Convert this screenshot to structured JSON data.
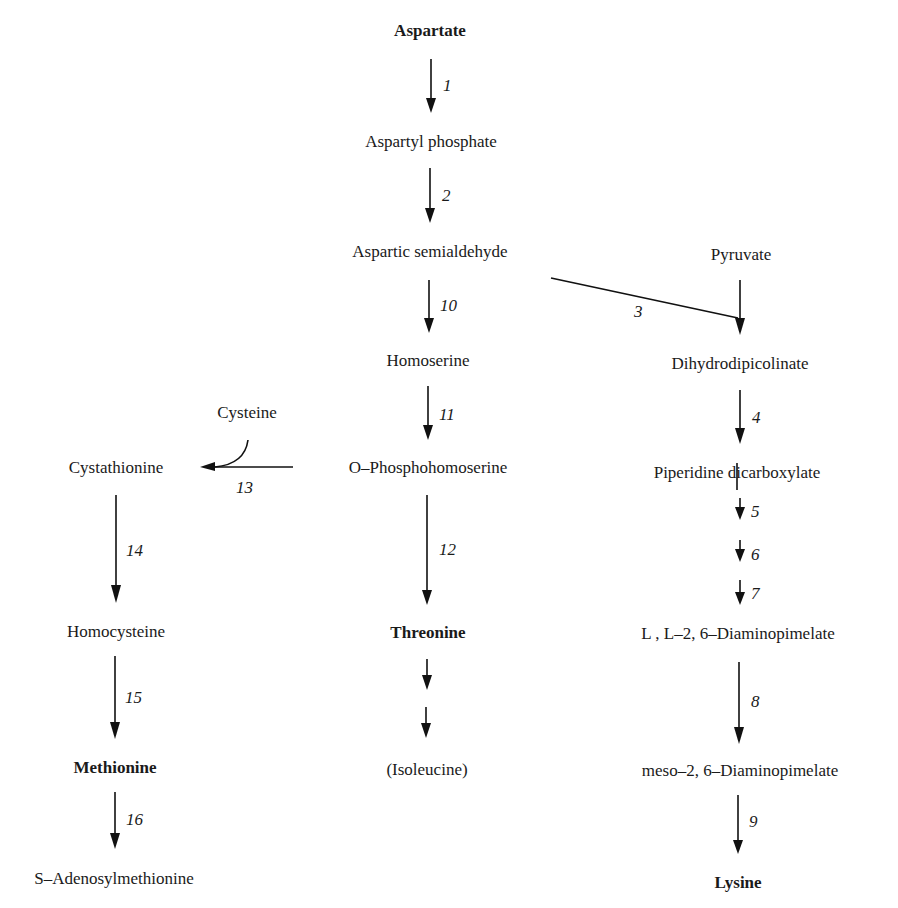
{
  "diagram": {
    "type": "metabolic-pathway",
    "nodes": {
      "aspartate": "Aspartate",
      "aspartyl_phosphate": "Aspartyl phosphate",
      "aspartic_semialdehyde": "Aspartic semialdehyde",
      "pyruvate": "Pyruvate",
      "homoserine": "Homoserine",
      "dihydrodipicolinate": "Dihydrodipicolinate",
      "cysteine": "Cysteine",
      "cystathionine": "Cystathionine",
      "o_phosphohomoserine": "O–Phosphohomoserine",
      "piperidine_dicarboxylate": "Piperidine dicarboxylate",
      "homocysteine": "Homocysteine",
      "threonine": "Threonine",
      "ll_diaminopimelate_prefix": "L , L",
      "ll_diaminopimelate_suffix": "–2, 6–Diaminopimelate",
      "methionine": "Methionine",
      "isoleucine": "(Isoleucine)",
      "meso_diaminopimelate": "meso–2, 6–Diaminopimelate",
      "s_adenosylmethionine": "S–Adenosylmethionine",
      "lysine": "Lysine"
    },
    "steps": {
      "s1": "1",
      "s2": "2",
      "s3": "3",
      "s4": "4",
      "s5": "5",
      "s6": "6",
      "s7": "7",
      "s8": "8",
      "s9": "9",
      "s10": "10",
      "s11": "11",
      "s12": "12",
      "s13": "13",
      "s14": "14",
      "s15": "15",
      "s16": "16"
    },
    "end_products_bold": [
      "Aspartate",
      "Threonine",
      "Methionine",
      "Lysine"
    ],
    "edges": [
      {
        "from": "Aspartate",
        "to": "Aspartyl phosphate",
        "step": "1"
      },
      {
        "from": "Aspartyl phosphate",
        "to": "Aspartic semialdehyde",
        "step": "2"
      },
      {
        "from": "Aspartic semialdehyde",
        "to": "Dihydrodipicolinate",
        "step": "3"
      },
      {
        "from": "Pyruvate",
        "to": "Dihydrodipicolinate",
        "step": "3"
      },
      {
        "from": "Dihydrodipicolinate",
        "to": "Piperidine dicarboxylate",
        "step": "4"
      },
      {
        "from": "Piperidine dicarboxylate",
        "to": "L,L-2,6-Diaminopimelate",
        "step": "5, 6, 7"
      },
      {
        "from": "L,L-2,6-Diaminopimelate",
        "to": "meso-2,6-Diaminopimelate",
        "step": "8"
      },
      {
        "from": "meso-2,6-Diaminopimelate",
        "to": "Lysine",
        "step": "9"
      },
      {
        "from": "Aspartic semialdehyde",
        "to": "Homoserine",
        "step": "10"
      },
      {
        "from": "Homoserine",
        "to": "O-Phosphohomoserine",
        "step": "11"
      },
      {
        "from": "O-Phosphohomoserine",
        "to": "Threonine",
        "step": "12"
      },
      {
        "from": "O-Phosphohomoserine",
        "to": "Cystathionine",
        "step": "13"
      },
      {
        "from": "Cysteine",
        "to": "Cystathionine",
        "step": "13"
      },
      {
        "from": "Cystathionine",
        "to": "Homocysteine",
        "step": "14"
      },
      {
        "from": "Homocysteine",
        "to": "Methionine",
        "step": "15"
      },
      {
        "from": "Methionine",
        "to": "S-Adenosylmethionine",
        "step": "16"
      },
      {
        "from": "Threonine",
        "to": "(Isoleucine)",
        "step": ""
      }
    ]
  }
}
